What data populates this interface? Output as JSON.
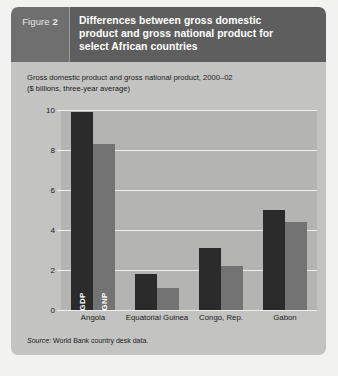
{
  "figure": {
    "label_prefix": "Figure",
    "number": "2",
    "title_lines": [
      "Differences between gross domestic",
      "product and gross national product for",
      "select African countries"
    ]
  },
  "subtitle_lines": [
    "Gross domestic product and gross national product, 2000–02",
    "($ billions, three-year average)"
  ],
  "source": {
    "prefix": "Source:",
    "text": " World Bank country desk data."
  },
  "colors": {
    "panel_background": "#c3c3c1",
    "header_number_block": "#6f6f6f",
    "header_title_block": "#5e5e5e",
    "plot_background": "#b4b4b2",
    "gridline": "#efefed",
    "gdp_bar": "#2b2b2b",
    "gnp_bar": "#737373",
    "text": "#1c1c1c",
    "header_text": "#ffffff"
  },
  "chart_data": {
    "type": "bar",
    "title": "Gross domestic product and gross national product, 2000–02",
    "subtitle": "($ billions, three-year average)",
    "xlabel": "",
    "ylabel": "",
    "ylim": [
      0,
      10
    ],
    "yticks": [
      0,
      2,
      4,
      6,
      8,
      10
    ],
    "ytick_labels": [
      "0",
      "2",
      "4",
      "6",
      "8",
      "10"
    ],
    "grid": true,
    "legend": "in-bar labels",
    "categories": [
      "Angola",
      "Equatorial Guinea",
      "Congo, Rep.",
      "Gabon"
    ],
    "series": [
      {
        "name": "GDP",
        "values": [
          9.9,
          1.8,
          3.1,
          5.0
        ]
      },
      {
        "name": "GNP",
        "values": [
          8.3,
          1.1,
          2.2,
          4.4
        ]
      }
    ],
    "annotations": [
      {
        "text": "GDP",
        "bar": "Angola-GDP"
      },
      {
        "text": "GNP",
        "bar": "Angola-GNP"
      }
    ]
  }
}
